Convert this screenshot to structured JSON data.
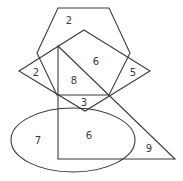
{
  "diagram": {
    "type": "overlapping-shapes-region-count",
    "stroke_color": "#3a3a3a",
    "shapes": [
      {
        "name": "hexagon",
        "points": [
          [
            58,
            8
          ],
          [
            109,
            8
          ],
          [
            130,
            53
          ],
          [
            109,
            95
          ],
          [
            57,
            95
          ],
          [
            37,
            53
          ]
        ]
      },
      {
        "name": "kite",
        "points": [
          [
            84,
            30
          ],
          [
            150,
            71
          ],
          [
            85,
            111
          ],
          [
            19,
            71
          ]
        ]
      },
      {
        "name": "right-triangle",
        "points": [
          [
            58,
            46
          ],
          [
            175,
            159
          ],
          [
            58,
            159
          ]
        ]
      },
      {
        "name": "ellipse",
        "cx": 73,
        "cy": 140,
        "rx": 62,
        "ry": 32
      }
    ],
    "labels": [
      {
        "id": "hexagon-top",
        "text": "2",
        "x": 69,
        "y": 20
      },
      {
        "id": "kite-left",
        "text": "2",
        "x": 36,
        "y": 72
      },
      {
        "id": "kite-center",
        "text": "6",
        "x": 96,
        "y": 61
      },
      {
        "id": "kite-right",
        "text": "5",
        "x": 133,
        "y": 72
      },
      {
        "id": "triangle-upper",
        "text": "8",
        "x": 74,
        "y": 80
      },
      {
        "id": "center-small",
        "text": "3",
        "x": 84,
        "y": 102
      },
      {
        "id": "ellipse-left",
        "text": "7",
        "x": 38,
        "y": 140
      },
      {
        "id": "ellipse-triangle",
        "text": "6",
        "x": 89,
        "y": 135
      },
      {
        "id": "triangle-right",
        "text": "9",
        "x": 149,
        "y": 148
      }
    ]
  }
}
